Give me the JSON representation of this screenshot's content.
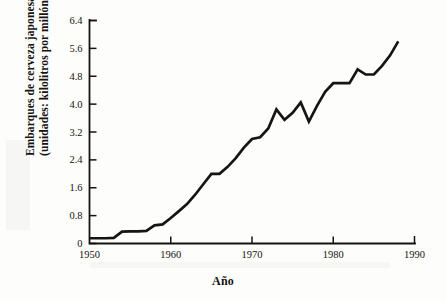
{
  "figure": {
    "background_color": "#fdfdfb",
    "ink_color": "#171512"
  },
  "axis_label_x": "Año",
  "axis_label_y_line1": "Embarques de cerveza japonesa",
  "axis_label_y_line2": "(unidades: kilolitros por millón)",
  "chart_data": {
    "type": "line",
    "title": "",
    "subtitle": "",
    "xlabel": "Año",
    "ylabel": "Embarques de cerveza japonesa (unidades: kilolitros por millón)",
    "xlim": [
      1950,
      1990
    ],
    "ylim": [
      0,
      6.4
    ],
    "grid": false,
    "legend": null,
    "legend_position": "none",
    "xticks": [
      1950,
      1960,
      1970,
      1980,
      1990
    ],
    "xticklabels": [
      "1950",
      "1960",
      "1970",
      "1980",
      "1990"
    ],
    "yticks": [
      0,
      0.8,
      1.6,
      2.4,
      3.2,
      4.0,
      4.8,
      5.6,
      6.4
    ],
    "yticklabels": [
      "0",
      "0.8",
      "1.6",
      "2.4",
      "3.2",
      "4.0",
      "4.8",
      "5.6",
      "6.4"
    ],
    "series": [
      {
        "name": "Embarques de cerveza japonesa",
        "color": "#171512",
        "x": [
          1950,
          1951,
          1952,
          1953,
          1954,
          1955,
          1956,
          1957,
          1958,
          1959,
          1960,
          1961,
          1962,
          1963,
          1964,
          1965,
          1966,
          1967,
          1968,
          1969,
          1970,
          1971,
          1972,
          1973,
          1974,
          1975,
          1976,
          1977,
          1978,
          1979,
          1980,
          1981,
          1982,
          1983,
          1984,
          1985,
          1986,
          1987,
          1988
        ],
        "values": [
          0.15,
          0.15,
          0.15,
          0.16,
          0.34,
          0.35,
          0.35,
          0.36,
          0.52,
          0.55,
          0.73,
          0.93,
          1.13,
          1.4,
          1.7,
          2.0,
          2.0,
          2.2,
          2.45,
          2.75,
          3.0,
          3.05,
          3.3,
          3.85,
          3.55,
          3.75,
          4.05,
          3.5,
          3.95,
          4.35,
          4.6,
          4.6,
          4.6,
          5.0,
          4.85,
          4.85,
          5.1,
          5.4,
          5.8
        ]
      }
    ]
  }
}
